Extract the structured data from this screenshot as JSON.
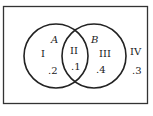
{
  "diagram": {
    "type": "venn",
    "universe_region": {
      "label": "IV",
      "value": ".3"
    },
    "sets": [
      {
        "name": "A"
      },
      {
        "name": "B"
      }
    ],
    "regions": [
      {
        "id": "I",
        "label": "I",
        "value": ".2"
      },
      {
        "id": "II",
        "label": "II",
        "value": ".1"
      },
      {
        "id": "III",
        "label": "III",
        "value": ".4"
      },
      {
        "id": "IV",
        "label": "IV",
        "value": ".3"
      }
    ],
    "caption": "",
    "colors": {
      "stroke": "#222222",
      "background": "#ffffff"
    }
  }
}
